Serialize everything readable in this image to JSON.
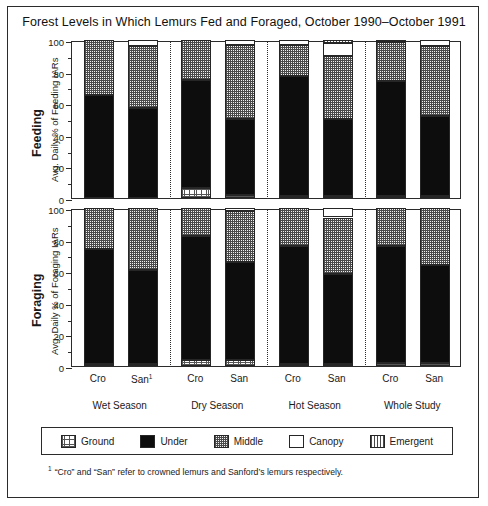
{
  "figure": {
    "title": "Forest Levels in Which Lemurs Fed and Foraged, October 1990–October 1991",
    "footnote_marker": "1",
    "footnote": "“Cro” and “San” refer to crowned lemurs and Sanford’s lemurs respectively."
  },
  "panels": {
    "feeding": {
      "side_title": "Feeding",
      "axis_label": "Avg. Daily % of Feeding IARs"
    },
    "foraging": {
      "side_title": "Foraging",
      "axis_label": "Avg. Daily % of Foraging IARs"
    }
  },
  "axis": {
    "yticks": [
      "0",
      "20",
      "40",
      "60",
      "80",
      "100"
    ],
    "ymin": 0,
    "ymax": 100
  },
  "groups": [
    {
      "label": "Wet Season",
      "bars": [
        "Cro",
        "San"
      ],
      "bar_footnote": "1"
    },
    {
      "label": "Dry Season",
      "bars": [
        "Cro",
        "San"
      ]
    },
    {
      "label": "Hot Season",
      "bars": [
        "Cro",
        "San"
      ]
    },
    {
      "label": "Whole Study",
      "bars": [
        "Cro",
        "San"
      ]
    }
  ],
  "legend": {
    "position": "below-plot",
    "items": [
      {
        "label": "Ground",
        "pattern": "fine-grid",
        "color": "#ffffff"
      },
      {
        "label": "Under",
        "pattern": "solid-black",
        "color": "#0d0d0d"
      },
      {
        "label": "Middle",
        "pattern": "checker-dots",
        "color": "#b8b8b8"
      },
      {
        "label": "Canopy",
        "pattern": "empty-white",
        "color": "#ffffff"
      },
      {
        "label": "Emergent",
        "pattern": "vertical-stripes",
        "color": "#ffffff"
      }
    ]
  },
  "chart_data": {
    "type": "bar",
    "subtype": "stacked-percentage",
    "title": "Forest Levels in Which Lemurs Fed and Foraged, October 1990–October 1991",
    "xlabel": "",
    "ylabel": "Avg. Daily % of IARs",
    "ylim": [
      0,
      100
    ],
    "yticks": [
      0,
      20,
      40,
      60,
      80,
      100
    ],
    "grid": false,
    "legend_position": "below-plot",
    "strata": [
      "Ground",
      "Under",
      "Middle",
      "Canopy",
      "Emergent"
    ],
    "categories": [
      "Wet Season Cro",
      "Wet Season San",
      "Dry Season Cro",
      "Dry Season San",
      "Hot Season Cro",
      "Hot Season San",
      "Whole Study Cro",
      "Whole Study San"
    ],
    "panels": [
      {
        "name": "Feeding",
        "ylabel": "Avg. Daily % of Feeding IARs",
        "bars": [
          {
            "group": "Wet Season",
            "taxon": "Cro",
            "Ground": 0,
            "Under": 65,
            "Middle": 35,
            "Canopy": 0,
            "Emergent": 0
          },
          {
            "group": "Wet Season",
            "taxon": "San",
            "Ground": 0,
            "Under": 57,
            "Middle": 39,
            "Canopy": 4,
            "Emergent": 0
          },
          {
            "group": "Dry Season",
            "taxon": "Cro",
            "Ground": 6.5,
            "Under": 68.5,
            "Middle": 25,
            "Canopy": 0,
            "Emergent": 0
          },
          {
            "group": "Dry Season",
            "taxon": "San",
            "Ground": 2,
            "Under": 48,
            "Middle": 47,
            "Canopy": 3,
            "Emergent": 0
          },
          {
            "group": "Hot Season",
            "taxon": "Cro",
            "Ground": 1,
            "Under": 76,
            "Middle": 20,
            "Canopy": 3,
            "Emergent": 0
          },
          {
            "group": "Hot Season",
            "taxon": "San",
            "Ground": 1,
            "Under": 49,
            "Middle": 40,
            "Canopy": 8,
            "Emergent": 2
          },
          {
            "group": "Whole Study",
            "taxon": "Cro",
            "Ground": 1,
            "Under": 73,
            "Middle": 25,
            "Canopy": 1,
            "Emergent": 0
          },
          {
            "group": "Whole Study",
            "taxon": "San",
            "Ground": 1,
            "Under": 51,
            "Middle": 44,
            "Canopy": 4,
            "Emergent": 0
          }
        ]
      },
      {
        "name": "Foraging",
        "ylabel": "Avg. Daily % of Foraging IARs",
        "bars": [
          {
            "group": "Wet Season",
            "taxon": "Cro",
            "Ground": 1.5,
            "Under": 72.5,
            "Middle": 26,
            "Canopy": 0,
            "Emergent": 0
          },
          {
            "group": "Wet Season",
            "taxon": "San",
            "Ground": 1.5,
            "Under": 59.5,
            "Middle": 39,
            "Canopy": 0,
            "Emergent": 0
          },
          {
            "group": "Dry Season",
            "taxon": "Cro",
            "Ground": 4,
            "Under": 78,
            "Middle": 18,
            "Canopy": 0,
            "Emergent": 0
          },
          {
            "group": "Dry Season",
            "taxon": "San",
            "Ground": 4,
            "Under": 62,
            "Middle": 32,
            "Canopy": 2,
            "Emergent": 0
          },
          {
            "group": "Hot Season",
            "taxon": "Cro",
            "Ground": 1.5,
            "Under": 74.5,
            "Middle": 24,
            "Canopy": 0,
            "Emergent": 0
          },
          {
            "group": "Hot Season",
            "taxon": "San",
            "Ground": 1.5,
            "Under": 56.5,
            "Middle": 36,
            "Canopy": 6,
            "Emergent": 0
          },
          {
            "group": "Whole Study",
            "taxon": "Cro",
            "Ground": 2,
            "Under": 74,
            "Middle": 24,
            "Canopy": 0,
            "Emergent": 0
          },
          {
            "group": "Whole Study",
            "taxon": "San",
            "Ground": 2,
            "Under": 62,
            "Middle": 36,
            "Canopy": 0,
            "Emergent": 0
          }
        ]
      }
    ]
  }
}
